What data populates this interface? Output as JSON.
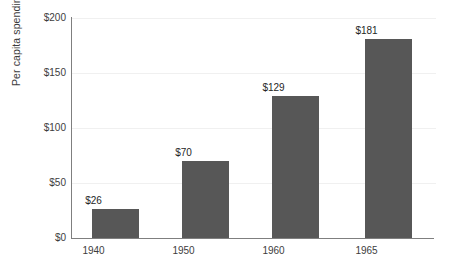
{
  "chart_data": {
    "type": "bar",
    "title": "",
    "xlabel": "",
    "ylabel": "Per capita spending",
    "categories": [
      "1940",
      "1950",
      "1960",
      "1965"
    ],
    "values": [
      26,
      70,
      129,
      181
    ],
    "value_labels": [
      "$26",
      "$70",
      "$129",
      "$181"
    ],
    "ylim": [
      0,
      200
    ],
    "ytick_values": [
      0,
      50,
      100,
      150,
      200
    ],
    "ytick_labels": [
      "$0",
      "$50",
      "$100",
      "$150",
      "$200"
    ],
    "grid": true,
    "grid_axis": "y",
    "legend": "none",
    "bar_color": "#575757",
    "gridline_color": "#f0f0f0",
    "axis_color": "#7f7f7f",
    "text_color": "#3d3d3d",
    "background_color": "#ffffff"
  }
}
